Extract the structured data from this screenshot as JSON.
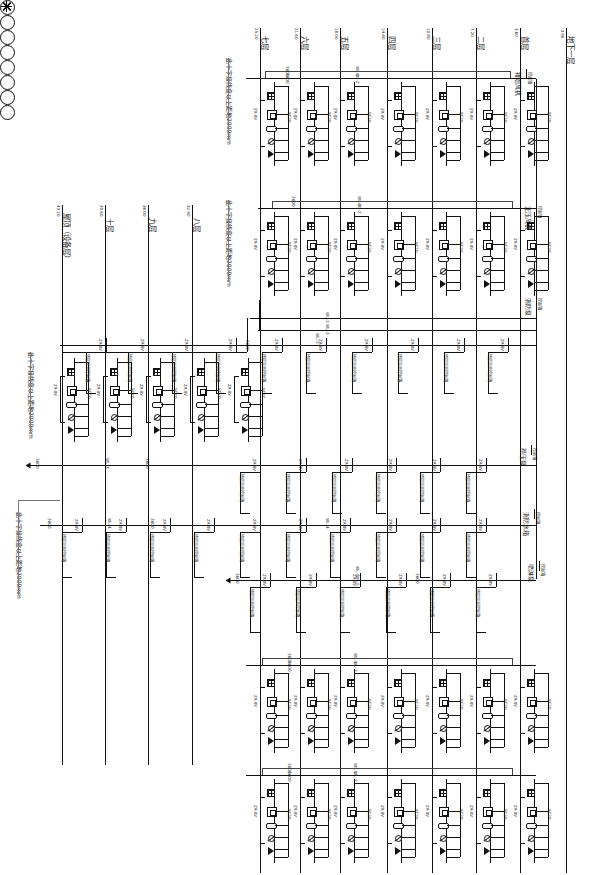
{
  "sheet": {
    "title": "消防电气系统图（竖向布置）",
    "orientation": "rotated-90",
    "bg": "#ffffff",
    "ink": "#111111"
  },
  "floors": {
    "label_suffix": "层",
    "right_group": [
      {
        "name": "七层",
        "elev": "25.20"
      },
      {
        "name": "六层",
        "elev": "21.60"
      },
      {
        "name": "五层",
        "elev": "18.00"
      },
      {
        "name": "四层",
        "elev": "14.40"
      },
      {
        "name": "三层",
        "elev": "10.80"
      },
      {
        "name": "二层",
        "elev": "7.20"
      },
      {
        "name": "首层",
        "elev": "3.60"
      },
      {
        "name": "地下一层",
        "elev": "-3.90"
      }
    ],
    "left_group": [
      {
        "name": "屋顶（设备层）",
        "elev": "43.20"
      },
      {
        "name": "十层",
        "elev": "39.60"
      },
      {
        "name": "九层",
        "elev": "36.00"
      },
      {
        "name": "八层",
        "elev": "32.40"
      }
    ]
  },
  "notes": [
    "此十字接线盒以上距地2000mm",
    "此十字接线盒以上距地2000mm",
    "此十字接线盒以上距地2000mm",
    "此十字接线盒以上距地2000mm"
  ],
  "dims": {
    "floor_height": "3600",
    "basement_height": "3900",
    "riser_drop": "2000",
    "tick_label": "3600"
  },
  "cables": {
    "bus_a": "WL-1",
    "bus_b": "WL-2",
    "bus_c": "WL-3",
    "bus_d": "WL-4",
    "bus_e": "WL-5",
    "riser_tag": "ZR-BV",
    "riser_spec": "SC20"
  },
  "devices": {
    "detector_label": "感烟探测器",
    "module_label": "输入输出模块",
    "isolator_label": "短路隔离器",
    "manual_label": "手动报警按钮",
    "bell_label": "声光报警器",
    "box_label": "层楼显示器",
    "panel_label": "消防电源监控箱",
    "control_label": "火灾报警控制器",
    "fan_label": "排烟风机",
    "pump_label": "消防泵",
    "spray_label": "喷淋泵",
    "jockey_label": "稳压泵"
  },
  "equipment_right": [
    {
      "symbol": "crossed-circle",
      "label": "排烟风机",
      "sub": "控制箱"
    },
    {
      "symbol": "crossed-circle",
      "label": "正压风机",
      "sub": "控制箱"
    },
    {
      "symbol": "crossed-circle",
      "label": "消防泵",
      "sub": "控制箱"
    },
    {
      "symbol": "crossed-circle-x3",
      "label": "喷淋泵",
      "sub": "控制箱"
    },
    {
      "symbol": "crossed-circle",
      "label": "稳压泵",
      "sub": "控制箱"
    },
    {
      "symbol": "crossed-circle",
      "label": "消防水箱",
      "sub": "控制箱"
    }
  ],
  "unit": {
    "tag_left": "ZR-BV",
    "tag_right": "SC20",
    "symbols": [
      "filled-square-detector",
      "open-square-module",
      "pill-isolator",
      "circle-thermal",
      "triangle-alarm"
    ]
  },
  "box_label_text": "楼层显示控制箱"
}
